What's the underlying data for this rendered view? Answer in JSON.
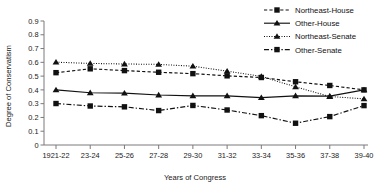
{
  "chart_data": {
    "type": "line",
    "title": "",
    "xlabel": "Years of Congress",
    "ylabel": "Degree of Conservatism",
    "categories": [
      "1921-22",
      "23-24",
      "25-26",
      "27-28",
      "29-30",
      "31-32",
      "33-34",
      "35-36",
      "37-38",
      "39-40"
    ],
    "ylim": [
      0,
      0.9
    ],
    "yticks": [
      "0",
      "0.1",
      "0.2",
      "0.3",
      "0.4",
      "0.5",
      "0.6",
      "0.7",
      "0.8",
      "0.9"
    ],
    "ytick_values": [
      0,
      0.1,
      0.2,
      0.3,
      0.4,
      0.5,
      0.6,
      0.7,
      0.8,
      0.9
    ],
    "grid": false,
    "legend_position": "top-right",
    "series": [
      {
        "name": "Northeast-House",
        "style": "dashed",
        "marker": "square",
        "values": [
          0.525,
          0.553,
          0.54,
          0.528,
          0.518,
          0.502,
          0.49,
          0.459,
          0.432,
          0.4
        ]
      },
      {
        "name": "Other-House",
        "style": "solid",
        "marker": "triangle",
        "values": [
          0.4,
          0.379,
          0.376,
          0.363,
          0.357,
          0.357,
          0.344,
          0.357,
          0.355,
          0.4
        ]
      },
      {
        "name": "Northeast-Senate",
        "style": "dotted",
        "marker": "triangle",
        "values": [
          0.601,
          0.592,
          0.588,
          0.585,
          0.572,
          0.536,
          0.498,
          0.422,
          0.352,
          0.335
        ]
      },
      {
        "name": "Other-Senate",
        "style": "dashdot",
        "marker": "square",
        "values": [
          0.301,
          0.283,
          0.277,
          0.25,
          0.287,
          0.254,
          0.213,
          0.158,
          0.206,
          0.286
        ]
      }
    ]
  }
}
